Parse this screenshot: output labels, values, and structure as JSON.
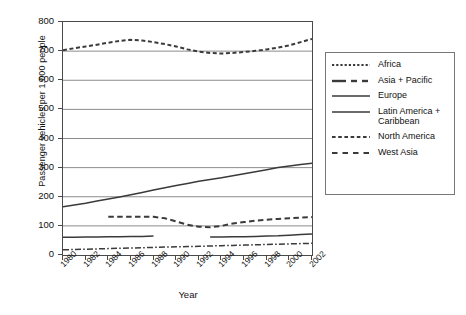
{
  "chart_data": {
    "type": "line",
    "title": "",
    "xlabel": "Year",
    "ylabel": "Passenger vehicles per 1,000 people",
    "xlim": [
      1980,
      2002
    ],
    "ylim": [
      0,
      800
    ],
    "yticks": [
      0,
      100,
      200,
      300,
      400,
      500,
      600,
      700,
      800
    ],
    "xticks": [
      1980,
      1982,
      1984,
      1986,
      1988,
      1990,
      1992,
      1994,
      1996,
      1998,
      2000,
      2002
    ],
    "grid": true,
    "legend_position": "right",
    "x": [
      1980,
      1981,
      1982,
      1983,
      1984,
      1985,
      1986,
      1987,
      1988,
      1989,
      1990,
      1991,
      1992,
      1993,
      1994,
      1995,
      1996,
      1997,
      1998,
      1999,
      2000,
      2001,
      2002
    ],
    "series": [
      {
        "name": "North America",
        "style": "dotted",
        "values": [
          703,
          710,
          716,
          722,
          729,
          735,
          739,
          736,
          731,
          724,
          716,
          706,
          698,
          694,
          692,
          694,
          697,
          701,
          706,
          712,
          720,
          731,
          742
        ]
      },
      {
        "name": "Africa",
        "style": "fine-dotted",
        "values": [
          null,
          null,
          null,
          null,
          null,
          null,
          null,
          null,
          null,
          null,
          null,
          null,
          null,
          null,
          null,
          null,
          null,
          null,
          null,
          null,
          null,
          null,
          null
        ]
      },
      {
        "name": "Europe",
        "style": "solid",
        "values": [
          166,
          172,
          178,
          185,
          192,
          199,
          207,
          215,
          223,
          231,
          239,
          246,
          253,
          259,
          265,
          272,
          279,
          286,
          293,
          300,
          306,
          311,
          315
        ]
      },
      {
        "name": "West Asia",
        "style": "dashed",
        "values": [
          null,
          null,
          null,
          null,
          131,
          131,
          131,
          131,
          131,
          126,
          115,
          104,
          97,
          95,
          100,
          108,
          113,
          118,
          121,
          124,
          126,
          128,
          130
        ]
      },
      {
        "name": "Latin America + Caribbean",
        "style": "solid",
        "values": [
          61,
          61,
          62,
          62,
          63,
          63,
          64,
          64,
          65,
          null,
          null,
          null,
          null,
          62,
          62,
          63,
          63,
          64,
          65,
          66,
          68,
          70,
          72
        ]
      },
      {
        "name": "Asia + Pacific",
        "style": "dash-dot",
        "values": [
          18,
          19,
          20,
          21,
          22,
          23,
          24,
          25,
          26,
          27,
          28,
          29,
          30,
          31,
          32,
          33,
          34,
          35,
          36,
          37,
          38,
          39,
          40
        ]
      }
    ]
  },
  "axes": {
    "ylabel": "Passenger vehicles per 1,000 people",
    "xlabel": "Year",
    "ytick_labels": [
      "800",
      "700",
      "600",
      "500",
      "400",
      "300",
      "200",
      "100",
      "0"
    ],
    "xtick_labels": [
      "1980",
      "1982",
      "1984",
      "1986",
      "1988",
      "1990",
      "1992",
      "1994",
      "1996",
      "1998",
      "2000",
      "2002"
    ]
  },
  "legend": {
    "items": [
      {
        "label": "Africa",
        "key": "fine-dotted-key"
      },
      {
        "label": "Asia + Pacific",
        "key": "dash-dot-key"
      },
      {
        "label": "Europe",
        "key": "solid-key"
      },
      {
        "label": "Latin America + Caribbean",
        "key": "solid-key"
      },
      {
        "label": "North America",
        "key": "dotted-key"
      },
      {
        "label": "West Asia",
        "key": "dash-wide-key"
      }
    ]
  },
  "colors": {
    "line": "#3a3a3a",
    "grid": "#8c8c8c",
    "frame": "#4a4a4a",
    "text": "#111111",
    "background": "#ffffff"
  }
}
